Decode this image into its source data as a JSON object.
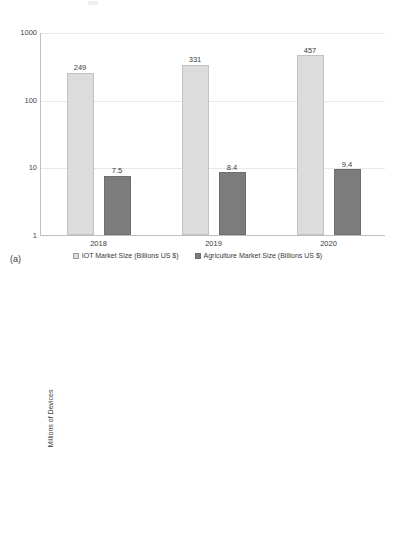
{
  "panels": {
    "a_caption": "(a)",
    "b_caption": "(b)"
  },
  "chart_data": [
    {
      "id": "iot-agriculture-market-size",
      "type": "bar",
      "title": "",
      "xlabel": "",
      "ylabel": "",
      "yscale": "log",
      "ylim": [
        1,
        1000
      ],
      "yticks": [
        "1",
        "10",
        "100",
        "1000"
      ],
      "grid": true,
      "legend_position": "bottom",
      "categories": [
        "2018",
        "2019",
        "2020"
      ],
      "series": [
        {
          "name": "IOT Market Size (Billions US $)",
          "color": "#dcdcdc",
          "values": [
            249,
            331,
            457
          ],
          "labels": [
            "249",
            "331",
            "457"
          ]
        },
        {
          "name": "Agriculture Market Size  (Billions US $)",
          "color": "#7c7c7c",
          "values": [
            7.5,
            8.4,
            9.4
          ],
          "labels": [
            "7.5",
            "8.4",
            "9.4"
          ]
        }
      ]
    },
    {
      "id": "iot-devices-by-sector",
      "type": "bar",
      "title": "",
      "xlabel": "",
      "ylabel": "Millions of Devices",
      "yscale": "log",
      "ylim": [
        1,
        1000
      ],
      "yticks": [
        "1",
        "10",
        "100",
        "1000"
      ],
      "grid": true,
      "legend_position": "none",
      "categories": [
        "Agriculture",
        "Food Services",
        "Healthcare",
        "Oil and Gas\nMining",
        "Transportation",
        "Utilities"
      ],
      "series": [
        {
          "name": "Millions of Devices",
          "values": [
            75,
            320,
            670,
            5.5,
            230,
            1100
          ],
          "colors": [
            "#7c7c7c",
            "#dcdcdc",
            "#dcdcdc",
            "#dcdcdc",
            "#dcdcdc",
            "#dcdcdc"
          ]
        }
      ]
    }
  ]
}
